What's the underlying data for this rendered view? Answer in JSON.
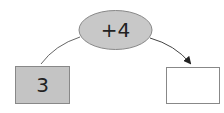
{
  "diagram": {
    "operation": {
      "label": "+4",
      "fill": "#c8c8c8"
    },
    "input_box": {
      "value": "3",
      "fill": "#c4c4c4"
    },
    "output_box": {
      "value": "",
      "fill": "#ffffff"
    },
    "stroke_color": "#666666"
  }
}
